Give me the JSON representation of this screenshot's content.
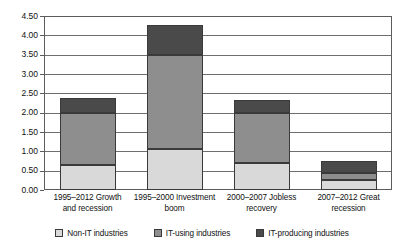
{
  "chart_data": {
    "type": "bar",
    "subtype": "stacked-bar",
    "title": "",
    "xlabel": "",
    "ylabel": "",
    "ylim": [
      0.0,
      4.5
    ],
    "ytick_step": 0.5,
    "ytick_labels": [
      "4.50",
      "4.00",
      "3.50",
      "3.00",
      "2.50",
      "2.00",
      "1.50",
      "1.00",
      "0.50",
      "0.00"
    ],
    "ytick_values": [
      4.5,
      4.0,
      3.5,
      3.0,
      2.5,
      2.0,
      1.5,
      1.0,
      0.5,
      0.0
    ],
    "grid": true,
    "grid_axis": "y",
    "legend_position": "bottom",
    "categories": [
      "1995–2012 Growth and recession",
      "1995–2000 Investment boom",
      "2000–2007 Jobless recovery",
      "2007–2012 Great recession"
    ],
    "category_lines": [
      [
        "1995–2012 Growth",
        "and recession"
      ],
      [
        "1995–2000 Investment",
        "boom"
      ],
      [
        "2000–2007 Jobless",
        "recovery"
      ],
      [
        "2007–2012 Great",
        "recession"
      ]
    ],
    "series": [
      {
        "name": "Non-IT industries",
        "color": "#d9d9d9",
        "values": [
          0.65,
          1.05,
          0.7,
          0.25
        ]
      },
      {
        "name": "IT-using industries",
        "color": "#8e8e8e",
        "values": [
          1.35,
          2.45,
          1.3,
          0.2
        ]
      },
      {
        "name": "IT-producing industries",
        "color": "#4a4a4a",
        "values": [
          0.38,
          0.78,
          0.33,
          0.3
        ]
      }
    ],
    "totals": [
      2.38,
      4.28,
      2.33,
      0.75
    ]
  },
  "legend": {
    "items": [
      {
        "label": "Non-IT industries",
        "swatch": "non-it"
      },
      {
        "label": "IT-using industries",
        "swatch": "it-using"
      },
      {
        "label": "IT-producing industries",
        "swatch": "it-producing"
      }
    ]
  },
  "colors": {
    "non_it": "#d9d9d9",
    "it_using": "#8e8e8e",
    "it_producing": "#4a4a4a",
    "axis": "#5c5c5c",
    "grid": "#6e6e6e",
    "background": "#ffffff"
  }
}
